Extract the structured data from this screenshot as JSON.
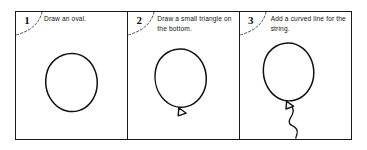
{
  "tutorial": {
    "subject": "balloon",
    "panel_count": 3,
    "border_color": "#1a1a1a",
    "ink_color": "#111111",
    "background_color": "#ffffff",
    "steps": [
      {
        "number": "1",
        "instruction": "Draw an oval.",
        "drawing": "oval"
      },
      {
        "number": "2",
        "instruction": "Draw a small triangle on the bottom.",
        "drawing": "oval-with-triangle"
      },
      {
        "number": "3",
        "instruction": "Add a curved line for the string.",
        "drawing": "balloon-with-string"
      }
    ]
  }
}
